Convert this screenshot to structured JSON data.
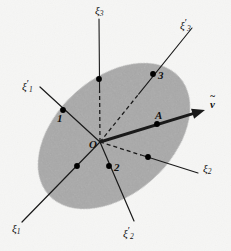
{
  "figure": {
    "background_color": "#fdfdfc",
    "ellipse_fill": "#a8a8a8",
    "line_color": "#1a1a1a",
    "dot_color": "#000000"
  },
  "ellipse": {
    "center_x": 114,
    "center_y": 136,
    "radius_x": 88,
    "radius_y": 58,
    "rotation_deg": -42
  },
  "origin": {
    "label": "O",
    "x": 100,
    "y": 142
  },
  "axes": [
    {
      "id": "xi3",
      "label_base": "ξ",
      "label_sub": "3",
      "label_prime": "",
      "label_text": "ξ3",
      "label_x": 95,
      "label_y": 5,
      "x1": 100,
      "y1": 142,
      "x2": 99,
      "y2": 19,
      "dashed_from_origin": true,
      "solid": false
    },
    {
      "id": "xi3-prime",
      "label_base": "ξ",
      "label_sub": "3",
      "label_prime": "′",
      "label_text": "ξ′3",
      "label_x": 180,
      "label_y": 18,
      "x1": 100,
      "y1": 142,
      "x2": 192,
      "y2": 28,
      "dashed_from_origin": true,
      "solid": false
    },
    {
      "id": "xi1-prime",
      "label_base": "ξ",
      "label_sub": "1",
      "label_prime": "′",
      "label_text": "ξ′1",
      "label_x": 22,
      "label_y": 79,
      "x1": 100,
      "y1": 142,
      "x2": 40,
      "y2": 87,
      "dashed_from_origin": false,
      "solid": true
    },
    {
      "id": "xi1",
      "label_base": "ξ",
      "label_sub": "1",
      "label_prime": "",
      "label_text": "ξ1",
      "label_x": 12,
      "label_y": 223,
      "x1": 100,
      "y1": 142,
      "x2": 22,
      "y2": 222,
      "dashed_from_origin": false,
      "solid": true
    },
    {
      "id": "xi2-prime",
      "label_base": "ξ",
      "label_sub": "2",
      "label_prime": "′",
      "label_text": "ξ′2",
      "label_x": 123,
      "label_y": 226,
      "x1": 100,
      "y1": 142,
      "x2": 134,
      "y2": 221,
      "dashed_from_origin": false,
      "solid": true
    },
    {
      "id": "xi2",
      "label_base": "ξ",
      "label_sub": "2",
      "label_prime": "",
      "label_text": "ξ2",
      "label_x": 203,
      "label_y": 163,
      "x1": 100,
      "y1": 142,
      "x2": 198,
      "y2": 173,
      "dashed_from_origin": true,
      "solid": false
    }
  ],
  "vector": {
    "label": "v",
    "label_x": 210,
    "label_y": 99,
    "has_tilde": true,
    "x1": 100,
    "y1": 142,
    "x2": 205,
    "y2": 110,
    "stroke_width": 3
  },
  "points": [
    {
      "label": "1",
      "dot_x": 63,
      "dot_y": 110,
      "label_x": 57,
      "label_y": 113
    },
    {
      "label": "2",
      "dot_x": 109,
      "dot_y": 166,
      "label_x": 114,
      "label_y": 162
    },
    {
      "label": "3",
      "dot_x": 153,
      "dot_y": 74,
      "label_x": 158,
      "label_y": 70
    },
    {
      "label": "A",
      "dot_x": 157,
      "dot_y": 124,
      "label_x": 155,
      "label_y": 110
    },
    {
      "label": "",
      "dot_x": 99,
      "dot_y": 79,
      "label_x": 0,
      "label_y": 0
    },
    {
      "label": "",
      "dot_x": 148,
      "dot_y": 157,
      "label_x": 0,
      "label_y": 0
    },
    {
      "label": "",
      "dot_x": 77,
      "dot_y": 166,
      "label_x": 0,
      "label_y": 0
    }
  ]
}
